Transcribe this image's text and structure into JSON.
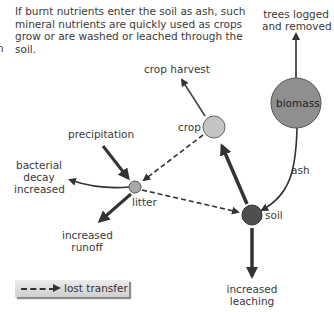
{
  "intro_text": "If burnt nutrients enter the soil as ash, such mineral nutrients are quickly used as crops grow or are washed or leached through the soil.",
  "cut_fragment": "n",
  "nodes": {
    "biomass": {
      "label": "biomass",
      "color": "#8f8f8f"
    },
    "crop": {
      "label": "crop",
      "color": "#c4c4c4"
    },
    "litter": {
      "label": "litter",
      "color": "#a8a8a8"
    },
    "soil": {
      "label": "soil",
      "color": "#4f4f4f"
    }
  },
  "labels": {
    "trees_logged": [
      "trees logged",
      "and removed"
    ],
    "crop_harvest": "crop harvest",
    "precipitation": "precipitation",
    "bacterial": [
      "bacterial",
      "decay",
      "increased"
    ],
    "runoff": [
      "increased",
      "runoff"
    ],
    "leaching": [
      "increased",
      "leaching"
    ],
    "ash": "ash"
  },
  "legend": {
    "label": "lost transfer",
    "style": "dashed-arrow"
  }
}
